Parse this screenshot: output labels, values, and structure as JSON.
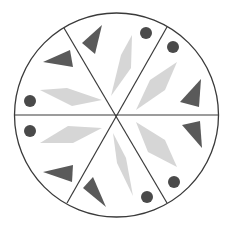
{
  "diagram": {
    "colors": {
      "background": "#ffffff",
      "outline": "#3a3a3a",
      "dark_shape": "#5a5a5a",
      "dot": "#4a4a4a",
      "light_shape": "#d6d6d6"
    },
    "circle": {
      "cx": 116.5,
      "cy": 115,
      "r": 102
    },
    "dividers": [
      {
        "x1": 64,
        "y1": 28,
        "x2": 167,
        "y2": 203
      },
      {
        "x1": 167,
        "y1": 27,
        "x2": 67,
        "y2": 203
      },
      {
        "x1": 14.5,
        "y1": 115,
        "x2": 218.5,
        "y2": 115
      }
    ],
    "light_parallelograms": [
      "111,96 121,55 132,35 131,68",
      "136,110 150,80 177,62 165,90",
      "136,122 165,140 177,167 148,152",
      "113,133 126,158 133,196 117,163",
      "40,143 68,126 102,128 73,143",
      "40,90 67,88 102,100 72,106"
    ],
    "dark_triangles": [
      "82,43 102,25 95,54",
      "180,102 201,79 199,107",
      "182,125 200,121 202,148",
      "83,188 93,177 106,207",
      "43,172 73,165 72,182",
      "43,62 70,50 73,67"
    ],
    "dots": [
      {
        "cx": 146,
        "cy": 33,
        "r": 6
      },
      {
        "cx": 173,
        "cy": 47,
        "r": 6
      },
      {
        "cx": 174,
        "cy": 182,
        "r": 6
      },
      {
        "cx": 147,
        "cy": 197,
        "r": 6
      },
      {
        "cx": 30,
        "cy": 131,
        "r": 6
      },
      {
        "cx": 30,
        "cy": 101,
        "r": 6
      }
    ]
  }
}
